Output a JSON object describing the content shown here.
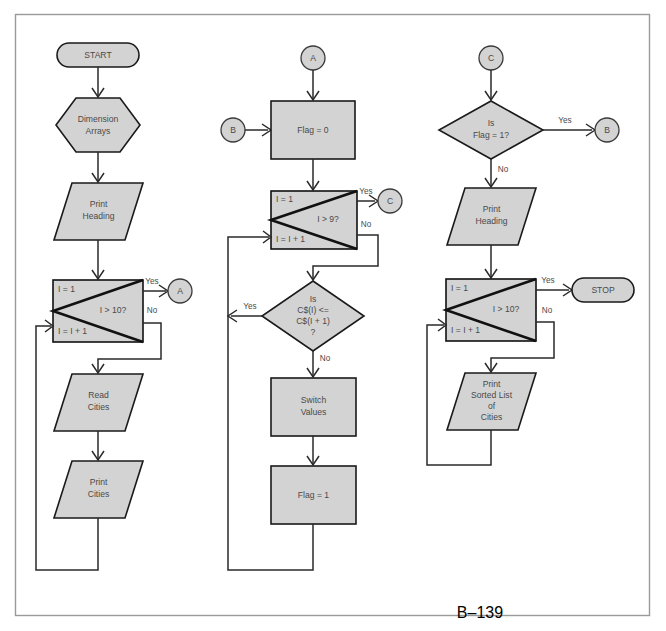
{
  "page": {
    "folio": "B–139",
    "frame_color": "#9a9a9a",
    "shape_fill": "#d3d3d3",
    "shape_stroke": "#1a1a1a",
    "text_color": "#4a4a4a"
  },
  "flowchart": {
    "title": "Sorting Cities Flowchart",
    "type": "flowchart",
    "columns": [
      {
        "id": "column-1",
        "nodes": [
          {
            "id": "start",
            "shape": "terminator",
            "text": "START"
          },
          {
            "id": "dim-arrays",
            "shape": "hexagon",
            "text": "Dimension Arrays",
            "lines": [
              "Dimension",
              "Arrays"
            ]
          },
          {
            "id": "print-heading-1",
            "shape": "parallelogram",
            "text": "Print Heading",
            "lines": [
              "Print",
              "Heading"
            ]
          },
          {
            "id": "loop-1",
            "shape": "loop",
            "init": "I = 1",
            "test": "I > 10?",
            "increment": "I = I + 1",
            "yes_label": "Yes",
            "no_label": "No",
            "yes_target": "A"
          },
          {
            "id": "read-cities",
            "shape": "parallelogram",
            "text": "Read Cities",
            "lines": [
              "Read",
              "Cities"
            ]
          },
          {
            "id": "print-cities",
            "shape": "parallelogram",
            "text": "Print Cities",
            "lines": [
              "Print",
              "Cities"
            ]
          }
        ],
        "connector_out": "A"
      },
      {
        "id": "column-2",
        "nodes": [
          {
            "id": "connector-a-in",
            "shape": "connector",
            "text": "A"
          },
          {
            "id": "connector-b-in",
            "shape": "connector",
            "text": "B"
          },
          {
            "id": "flag-zero",
            "shape": "process",
            "text": "Flag = 0"
          },
          {
            "id": "loop-2",
            "shape": "loop",
            "init": "I = 1",
            "test": "I > 9?",
            "increment": "I = I + 1",
            "yes_label": "Yes",
            "no_label": "No",
            "yes_target": "C"
          },
          {
            "id": "compare",
            "shape": "decision",
            "lines": [
              "Is",
              "C$(I) <=",
              "C$(I + 1)",
              "?"
            ],
            "yes_label": "Yes",
            "no_label": "No"
          },
          {
            "id": "switch-values",
            "shape": "process",
            "text": "Switch Values",
            "lines": [
              "Switch",
              "Values"
            ]
          },
          {
            "id": "flag-one",
            "shape": "process",
            "text": "Flag = 1"
          }
        ],
        "connector_out": "C"
      },
      {
        "id": "column-3",
        "nodes": [
          {
            "id": "connector-c-in",
            "shape": "connector",
            "text": "C"
          },
          {
            "id": "is-flag-one",
            "shape": "decision",
            "lines": [
              "Is",
              "Flag = 1?"
            ],
            "yes_label": "Yes",
            "no_label": "No",
            "yes_target": "B"
          },
          {
            "id": "connector-b-out",
            "shape": "connector",
            "text": "B"
          },
          {
            "id": "print-heading-2",
            "shape": "parallelogram",
            "text": "Print Heading",
            "lines": [
              "Print",
              "Heading"
            ]
          },
          {
            "id": "loop-3",
            "shape": "loop",
            "init": "I = 1",
            "test": "I > 10?",
            "increment": "I = I + 1",
            "yes_label": "Yes",
            "no_label": "No",
            "yes_target": "STOP"
          },
          {
            "id": "stop",
            "shape": "terminator",
            "text": "STOP"
          },
          {
            "id": "print-sorted",
            "shape": "parallelogram",
            "text": "Print Sorted List of Cities",
            "lines": [
              "Print",
              "Sorted List",
              "of",
              "Cities"
            ]
          }
        ]
      }
    ],
    "labels": {
      "yes": "Yes",
      "no": "No"
    }
  }
}
